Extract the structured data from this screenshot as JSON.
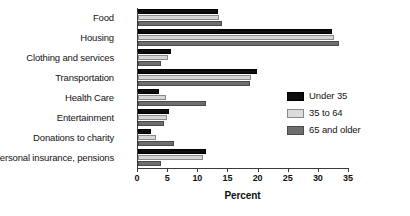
{
  "chart_data": {
    "type": "bar",
    "orientation": "horizontal",
    "title": "",
    "xlabel": "Percent",
    "ylabel": "",
    "xlim": [
      0,
      35
    ],
    "xticks": [
      0,
      5,
      10,
      15,
      20,
      25,
      30,
      35
    ],
    "grid": false,
    "legend_position": "right",
    "categories": [
      "Food",
      "Housing",
      "Clothing and services",
      "Transportation",
      "Health Care",
      "Entertainment",
      "Donations to charity",
      "Personal insurance, pensions"
    ],
    "series": [
      {
        "name": "Under 35",
        "color": "#0d0d0d",
        "values": [
          13.2,
          32.2,
          5.5,
          19.8,
          3.5,
          5.2,
          2.2,
          11.3
        ]
      },
      {
        "name": "35 to 64",
        "color": "#d6d6d6",
        "values": [
          13.5,
          32.5,
          5.0,
          18.8,
          4.7,
          4.8,
          3.0,
          10.8
        ]
      },
      {
        "name": "65 and older",
        "color": "#6e6e6e",
        "values": [
          14.0,
          33.3,
          3.8,
          18.5,
          11.3,
          4.3,
          5.9,
          3.8
        ]
      }
    ]
  },
  "legend": {
    "items": [
      {
        "label": "Under 35"
      },
      {
        "label": "35 to 64"
      },
      {
        "label": "65 and older"
      }
    ]
  },
  "axis": {
    "x_title": "Percent",
    "tick_labels": [
      "0",
      "5",
      "10",
      "15",
      "20",
      "25",
      "30",
      "35"
    ]
  }
}
